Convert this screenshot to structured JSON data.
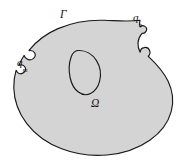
{
  "figure": {
    "kind": "domain-boundary-diagram",
    "background_color": "#ffffff",
    "domain_fill_color": "#d4d4d4",
    "domain_stroke_color": "#1a1a1a",
    "void_fill_color": "#d4d4d4",
    "void_stroke_color": "#1a1a1a",
    "label_color": "#111111"
  },
  "labels": {
    "boundary": {
      "text": "Γ",
      "name": "Gamma",
      "meaning": "boundary-curve"
    },
    "domain": {
      "text": "Ω",
      "name": "Omega",
      "meaning": "domain-interior"
    },
    "flux_left": {
      "base": "q",
      "subscript": "m",
      "name": "q-m",
      "meaning": "boundary-flux-m"
    },
    "flux_right": {
      "base": "q",
      "subscript": "n",
      "name": "q-n",
      "meaning": "boundary-flux-n"
    }
  }
}
